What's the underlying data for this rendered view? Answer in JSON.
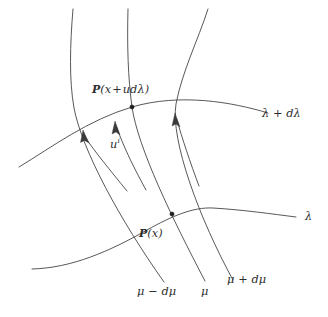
{
  "figure": {
    "kind": "geometry-diagram",
    "background_color": "#ffffff",
    "ink_color": "#3a3a3a",
    "point_color": "#1c1c1c"
  },
  "labels": {
    "point_upper": {
      "operator": "℘",
      "operator_plain": "P",
      "open": "(",
      "argument_x": "x",
      "plus": "+",
      "argument_rest": "udλ",
      "close": ")",
      "full": "℘(x + udλ)"
    },
    "point_lower": {
      "operator": "℘",
      "operator_plain": "P",
      "open": "(",
      "argument_x": "x",
      "close": ")",
      "full": "℘(x)"
    },
    "vector_field": {
      "base": "u",
      "superscript": "i",
      "full": "uⁱ"
    },
    "curve_lambda_plus_dlambda": "λ + dλ",
    "curve_lambda": "λ",
    "curve_mu_minus_dmu": "μ − dμ",
    "curve_mu": "μ",
    "curve_mu_plus_dmu": "μ + dμ"
  },
  "geometry": {
    "lambda_plus_dlambda_path": "M 19,167 C 52,147 88,120 132,107 C 180,93 232,102 268,113",
    "lambda_path": "M 32,269 C 72,268 110,251 147,230 C 172,216 193,207 213,208 C 245,210 272,214 296,217",
    "mu_minus_dmu_path": "M 73,9 C 70,45 69,80 74,108 C 82,150 120,220 164,282",
    "mu_path": "M 128,9 C 127,45 128,78 132,107 C 138,148 172,218 205,281",
    "mu_plus_dmu_path": "M 208,9 C 198,40 182,72 176,104 C 170,140 200,220 233,280",
    "arrow1": {
      "path": "M 127,191 C 110,170 95,152 85,137",
      "tip": [
        83,
        132
      ]
    },
    "arrow2": {
      "path": "M 146,190 C 134,168 124,148 117,128",
      "tip": [
        115,
        123
      ]
    },
    "arrow3": {
      "path": "M 199,186 C 190,162 182,138 177,120",
      "tip": [
        175,
        115
      ]
    },
    "dot_upper": [
      132,
      107
    ],
    "dot_lower": [
      172,
      214
    ],
    "dot_radius": 2.1
  }
}
